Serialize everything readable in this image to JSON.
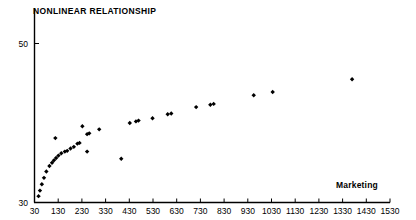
{
  "chart_data": {
    "type": "scatter",
    "title": "NONLINEAR RELATIONSHIP",
    "xlabel": "Marketing",
    "ylabel": "",
    "grid": false,
    "legend": false,
    "xlim": [
      30,
      1530
    ],
    "ylim": [
      30,
      53.6
    ],
    "xticks": [
      30,
      130,
      230,
      330,
      430,
      530,
      630,
      730,
      830,
      930,
      1030,
      1130,
      1230,
      1330,
      1430,
      1530
    ],
    "xtick_labels": [
      "30",
      "130",
      "230",
      "330",
      "430",
      "530",
      "630",
      "730",
      "830",
      "930",
      "1030",
      "1130",
      "1230",
      "1330",
      "1430",
      "1530"
    ],
    "yticks": [
      30,
      50
    ],
    "ytick_labels": [
      "30",
      "50"
    ],
    "marker": "diamond",
    "marker_color": "#000000",
    "points": [
      {
        "x": 47,
        "y": 30.8
      },
      {
        "x": 53,
        "y": 31.5
      },
      {
        "x": 61,
        "y": 32.3
      },
      {
        "x": 70,
        "y": 33.1
      },
      {
        "x": 80,
        "y": 33.9
      },
      {
        "x": 93,
        "y": 34.6
      },
      {
        "x": 104,
        "y": 35.0
      },
      {
        "x": 112,
        "y": 35.3
      },
      {
        "x": 121,
        "y": 35.6
      },
      {
        "x": 131,
        "y": 35.9
      },
      {
        "x": 143,
        "y": 36.2
      },
      {
        "x": 118,
        "y": 38.1
      },
      {
        "x": 158,
        "y": 36.4
      },
      {
        "x": 168,
        "y": 36.5
      },
      {
        "x": 182,
        "y": 36.8
      },
      {
        "x": 196,
        "y": 37.0
      },
      {
        "x": 211,
        "y": 37.4
      },
      {
        "x": 220,
        "y": 37.5
      },
      {
        "x": 232,
        "y": 39.6
      },
      {
        "x": 252,
        "y": 38.6
      },
      {
        "x": 261,
        "y": 38.7
      },
      {
        "x": 252,
        "y": 36.4
      },
      {
        "x": 303,
        "y": 39.2
      },
      {
        "x": 396,
        "y": 35.5
      },
      {
        "x": 432,
        "y": 40.0
      },
      {
        "x": 458,
        "y": 40.2
      },
      {
        "x": 469,
        "y": 40.3
      },
      {
        "x": 528,
        "y": 40.6
      },
      {
        "x": 592,
        "y": 41.1
      },
      {
        "x": 607,
        "y": 41.2
      },
      {
        "x": 712,
        "y": 42.0
      },
      {
        "x": 772,
        "y": 42.3
      },
      {
        "x": 786,
        "y": 42.4
      },
      {
        "x": 955,
        "y": 43.5
      },
      {
        "x": 1035,
        "y": 43.9
      },
      {
        "x": 1370,
        "y": 45.5
      }
    ]
  },
  "axes": {
    "x_axis_name": "marketing-axis",
    "y_axis_name": "value-axis"
  }
}
